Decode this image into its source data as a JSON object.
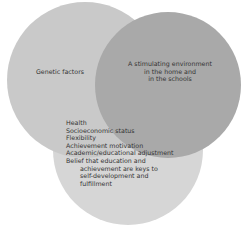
{
  "diagram": {
    "type": "venn",
    "circles": [
      {
        "id": "genetic",
        "label": "Genetic factors",
        "color": "#c9c9c9"
      },
      {
        "id": "environment",
        "label_lines": [
          "A stimulating environment",
          "in the home and",
          "in the schools"
        ],
        "color": "#a9a9a9"
      },
      {
        "id": "personal",
        "items": [
          "Health",
          "Socioeconomic status",
          "Flexibility",
          "Achievement motivation",
          "Academic/educational adjustment",
          "Belief that education and"
        ],
        "continuation": [
          "achievement are keys to",
          "self-development and",
          "fulfillment"
        ],
        "color": "#d6d6d6"
      }
    ]
  }
}
